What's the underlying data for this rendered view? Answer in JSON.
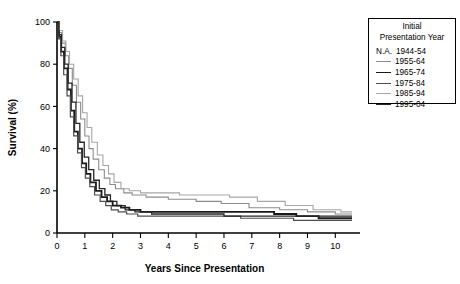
{
  "legend": {
    "title_line1": "Initial",
    "title_line2": "Presentation Year",
    "na_prefix": "N.A.",
    "entries": [
      {
        "label": "1944-54",
        "color": "#000000",
        "width": 0,
        "has_swatch": false,
        "na": true
      },
      {
        "label": "1955-64",
        "color": "#8c8c8c",
        "width": 1.1,
        "has_swatch": true,
        "na": false
      },
      {
        "label": "1965-74",
        "color": "#1a1a1a",
        "width": 1.8,
        "has_swatch": true,
        "na": false
      },
      {
        "label": "1975-84",
        "color": "#4d4d4d",
        "width": 1.2,
        "has_swatch": true,
        "na": false
      },
      {
        "label": "1985-94",
        "color": "#a6a6a6",
        "width": 1.1,
        "has_swatch": true,
        "na": false
      },
      {
        "label": "1995-04",
        "color": "#262626",
        "width": 1.3,
        "has_swatch": true,
        "na": false
      }
    ]
  },
  "chart_data": {
    "type": "line",
    "title": "",
    "xlabel": "Years Since Presentation",
    "ylabel": "Survival (%)",
    "xlim": [
      0,
      10.6
    ],
    "ylim": [
      0,
      100
    ],
    "xticks": [
      0,
      1,
      2,
      3,
      4,
      5,
      6,
      7,
      8,
      9,
      10
    ],
    "yticks": [
      0,
      20,
      40,
      60,
      80,
      100
    ],
    "grid": false,
    "legend_position": "right-outside",
    "curve_style": "step",
    "series": [
      {
        "name": "1944-54",
        "color": "#000000",
        "width": 0,
        "note": "N.A. - not available, no curve plotted",
        "x": [],
        "y": []
      },
      {
        "name": "1955-64",
        "color": "#8c8c8c",
        "width": 1.1,
        "x": [
          0,
          0.08,
          0.17,
          0.3,
          0.42,
          0.55,
          0.7,
          0.85,
          1.0,
          1.15,
          1.3,
          1.5,
          1.7,
          1.9,
          2.1,
          2.4,
          2.7,
          3.2,
          4.0,
          5.0,
          5.9,
          6.9,
          8.0,
          9.0,
          10.0,
          10.6
        ],
        "y": [
          100,
          95,
          90,
          84,
          78,
          70,
          62,
          54,
          46,
          40,
          35,
          30,
          26,
          23,
          21,
          19,
          18,
          17,
          16,
          15,
          14,
          12,
          11,
          10,
          9,
          9
        ]
      },
      {
        "name": "1965-74",
        "color": "#1a1a1a",
        "width": 1.8,
        "x": [
          0,
          0.07,
          0.15,
          0.25,
          0.38,
          0.5,
          0.62,
          0.75,
          0.9,
          1.05,
          1.2,
          1.4,
          1.6,
          1.8,
          2.0,
          2.3,
          2.6,
          3.0,
          3.8,
          4.8,
          5.8,
          6.8,
          7.8,
          8.6,
          9.4,
          10.6
        ],
        "y": [
          100,
          93,
          86,
          78,
          68,
          58,
          48,
          40,
          33,
          28,
          24,
          20,
          17,
          15,
          13,
          12,
          11,
          10,
          10,
          10,
          10,
          10,
          9,
          8,
          7,
          7
        ]
      },
      {
        "name": "1975-84",
        "color": "#4d4d4d",
        "width": 1.2,
        "x": [
          0,
          0.06,
          0.14,
          0.24,
          0.36,
          0.48,
          0.6,
          0.74,
          0.88,
          1.02,
          1.18,
          1.35,
          1.55,
          1.75,
          1.95,
          2.2,
          2.5,
          2.9,
          3.6,
          4.6,
          5.6,
          6.6,
          7.6,
          8.5,
          9.5,
          10.6
        ],
        "y": [
          100,
          92,
          84,
          75,
          65,
          55,
          46,
          38,
          31,
          26,
          22,
          18,
          15,
          13,
          11,
          10,
          9,
          8,
          8,
          8,
          8,
          7,
          7,
          6,
          6,
          6
        ]
      },
      {
        "name": "1985-94",
        "color": "#a6a6a6",
        "width": 1.1,
        "x": [
          0,
          0.09,
          0.2,
          0.32,
          0.45,
          0.6,
          0.76,
          0.92,
          1.08,
          1.25,
          1.45,
          1.65,
          1.85,
          2.05,
          2.3,
          2.6,
          3.0,
          3.6,
          4.4,
          5.4,
          6.2,
          7.2,
          8.2,
          9.2,
          10.2,
          10.6
        ],
        "y": [
          100,
          96,
          91,
          86,
          80,
          73,
          65,
          57,
          50,
          43,
          37,
          32,
          28,
          24,
          21,
          20,
          19,
          19,
          18,
          18,
          17,
          15,
          13,
          11,
          10,
          10
        ]
      },
      {
        "name": "1995-04",
        "color": "#262626",
        "width": 1.3,
        "x": [
          0,
          0.07,
          0.16,
          0.28,
          0.4,
          0.54,
          0.68,
          0.82,
          0.98,
          1.14,
          1.32,
          1.52,
          1.72,
          1.92,
          2.15,
          2.45,
          2.8,
          3.4,
          4.2,
          5.2,
          6.0,
          7.0,
          8.0,
          9.0,
          10.0,
          10.6
        ],
        "y": [
          100,
          94,
          88,
          80,
          71,
          62,
          52,
          43,
          36,
          30,
          25,
          21,
          18,
          15,
          13,
          11,
          10,
          9,
          9,
          9,
          8,
          8,
          8,
          8,
          8,
          8
        ]
      }
    ]
  }
}
